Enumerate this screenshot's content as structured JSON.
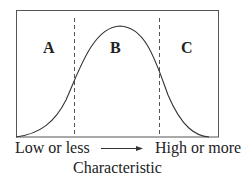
{
  "diagram": {
    "type": "normal-distribution-regions",
    "regions": [
      {
        "id": "A",
        "label": "A"
      },
      {
        "id": "B",
        "label": "B"
      },
      {
        "id": "C",
        "label": "C"
      }
    ],
    "axis": {
      "left_label": "Low or less",
      "right_label": "High or more",
      "title": "Characteristic",
      "arrow": "right-arrow"
    },
    "colors": {
      "line": "#333333",
      "border": "#444444",
      "background": "#ffffff"
    }
  }
}
